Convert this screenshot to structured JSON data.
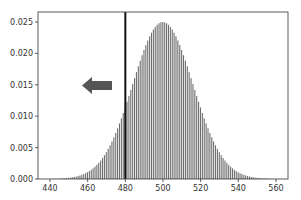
{
  "chart_data": {
    "type": "bar",
    "title": "",
    "xlabel": "",
    "ylabel": "",
    "distribution": "binomial-like (approx. normal), mean 500, sd ~16",
    "x_range": [
      430,
      570
    ],
    "ylim": [
      0.0,
      0.0265
    ],
    "xticks": [
      440,
      460,
      480,
      500,
      520,
      540,
      560
    ],
    "yticks": [
      "0.000",
      "0.005",
      "0.010",
      "0.015",
      "0.020",
      "0.025"
    ],
    "peak": {
      "x": 500,
      "y": 0.025
    },
    "vertical_line": {
      "x": 480,
      "color": "#111111"
    },
    "annotation": {
      "type": "arrow",
      "direction": "left",
      "color": "#555555"
    },
    "bar_color": "#6e6e6e",
    "grid": false,
    "x": [
      440,
      445,
      450,
      455,
      460,
      465,
      470,
      475,
      480,
      485,
      490,
      495,
      500,
      505,
      510,
      515,
      520,
      525,
      530,
      535,
      540,
      545,
      550,
      555,
      560
    ],
    "values": [
      2e-05,
      9e-05,
      0.00035,
      0.00105,
      0.0027,
      0.0057,
      0.0103,
      0.0153,
      0.0195,
      0.0224,
      0.024,
      0.0248,
      0.025,
      0.0248,
      0.024,
      0.0224,
      0.0195,
      0.0153,
      0.0103,
      0.0057,
      0.0027,
      0.00105,
      0.00035,
      9e-05,
      2e-05
    ]
  }
}
